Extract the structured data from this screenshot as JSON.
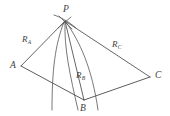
{
  "figure": {
    "type": "geometric-diagram",
    "background_color": "#ffffff",
    "line_color": "#4a4a4a",
    "curve_color": "#555555",
    "width": 170,
    "height": 116,
    "vertices": [
      {
        "id": "P",
        "label": "P",
        "x": 65,
        "y": 21
      },
      {
        "id": "A",
        "label": "A",
        "x": 21,
        "y": 66
      },
      {
        "id": "B",
        "label": "B",
        "x": 84,
        "y": 100
      },
      {
        "id": "C",
        "label": "C",
        "x": 150,
        "y": 77
      }
    ],
    "range_labels": [
      {
        "id": "RA",
        "symbol": "R",
        "subscript": "A",
        "x": 22,
        "y": 35
      },
      {
        "id": "RB",
        "symbol": "R",
        "subscript": "B",
        "x": 76,
        "y": 71
      },
      {
        "id": "RC",
        "symbol": "R",
        "subscript": "C",
        "x": 112,
        "y": 40
      }
    ],
    "range_lines": [
      {
        "id": "P-A",
        "from": "P",
        "to": "A"
      },
      {
        "id": "P-B",
        "from": "P",
        "to": "B"
      },
      {
        "id": "P-C",
        "from": "P",
        "to": "C"
      }
    ],
    "base_edges": [
      {
        "id": "A-B",
        "from": "A",
        "to": "B"
      },
      {
        "id": "B-C",
        "from": "B",
        "to": "C"
      }
    ],
    "arcs": [
      {
        "id": "arc-A",
        "note": "position line through P curving down past AB"
      },
      {
        "id": "arc-B",
        "note": "position line through P curving down toward B"
      },
      {
        "id": "arc-C",
        "note": "position line through P curving down past BC"
      },
      {
        "id": "arc-top",
        "note": "short arc crossing above P"
      }
    ]
  }
}
